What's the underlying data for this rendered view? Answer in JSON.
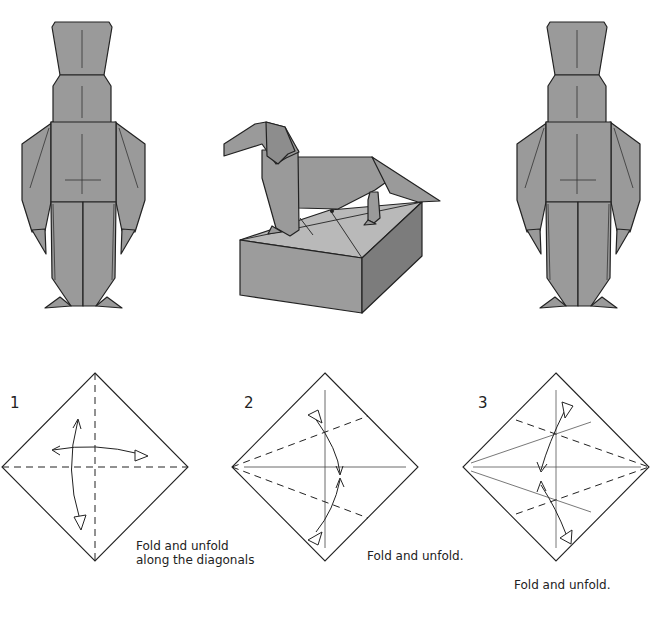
{
  "page": {
    "background": "#ffffff",
    "paper_color": "#9a9a9a",
    "box_colors": {
      "top": "#b9b9b9",
      "front": "#9c9c9c",
      "side": "#7c7c7c"
    },
    "line_color": "#222222"
  },
  "illustrations": [
    {
      "id": "soldier-front",
      "description": "Origami toy soldier, front view"
    },
    {
      "id": "dog-on-box",
      "description": "Origami dachshund standing on an origami box"
    },
    {
      "id": "soldier-back",
      "description": "Origami toy soldier, back view"
    }
  ],
  "steps": [
    {
      "number": "1",
      "caption_lines": [
        "Fold and unfold",
        "along the diagonals"
      ]
    },
    {
      "number": "2",
      "caption_lines": [
        "Fold and unfold."
      ]
    },
    {
      "number": "3",
      "caption_lines": [
        "Fold and unfold."
      ]
    }
  ]
}
